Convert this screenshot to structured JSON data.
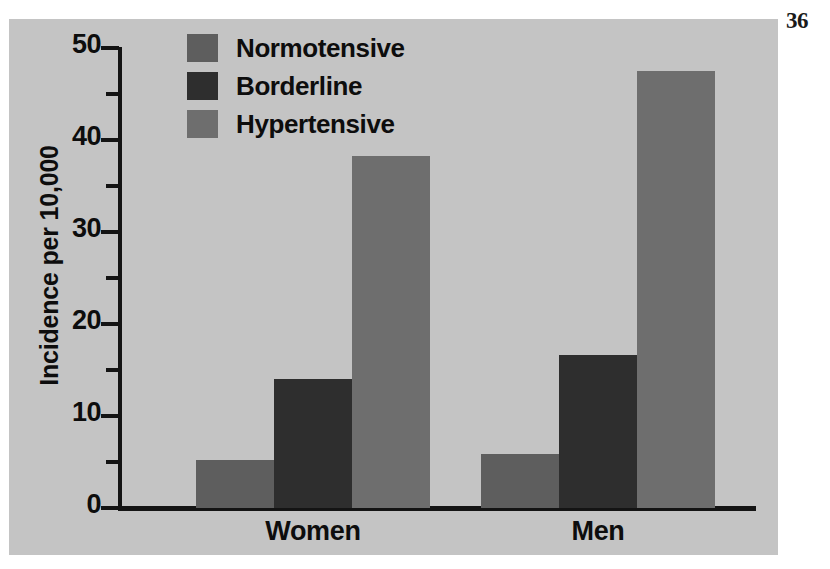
{
  "page_number": "36",
  "colors": {
    "panel_background": "#c4c4c4",
    "axis": "#141414",
    "text": "#0d0d0d",
    "normotensive": "#5e5e5e",
    "borderline": "#2e2e2e",
    "hypertensive": "#6e6e6e"
  },
  "legend": {
    "position": "top-left-inside",
    "entries": [
      {
        "label": "Normotensive",
        "color": "#5e5e5e"
      },
      {
        "label": "Borderline",
        "color": "#2e2e2e"
      },
      {
        "label": "Hypertensive",
        "color": "#6e6e6e"
      }
    ]
  },
  "axes": {
    "y_title": "Incidence per 10,000",
    "y_major_ticks": [
      "0",
      "10",
      "20",
      "30",
      "40",
      "50"
    ],
    "y_minor_ticks": [
      "5",
      "15",
      "25",
      "35",
      "45"
    ],
    "x_labels": [
      "Women",
      "Men"
    ]
  },
  "chart_data": {
    "type": "bar",
    "title": "",
    "xlabel": "",
    "ylabel": "Incidence per 10,000",
    "ylim": [
      0,
      50
    ],
    "ytick_step": 10,
    "yminor_step": 5,
    "grid": false,
    "legend_position": "upper left",
    "categories": [
      "Women",
      "Men"
    ],
    "series": [
      {
        "name": "Normotensive",
        "color": "#5e5e5e",
        "values": [
          5.2,
          5.9
        ]
      },
      {
        "name": "Borderline",
        "color": "#2e2e2e",
        "values": [
          14.0,
          16.6
        ]
      },
      {
        "name": "Hypertensive",
        "color": "#6e6e6e",
        "values": [
          38.3,
          47.5
        ]
      }
    ]
  },
  "geometry": {
    "baseline_px": 489,
    "top_value_px": 29,
    "px_per_unit": 9.2,
    "group_left_px": [
      187,
      472
    ],
    "bar_width_px": 78
  }
}
